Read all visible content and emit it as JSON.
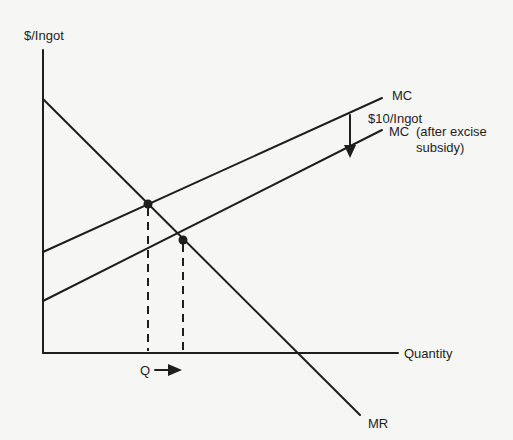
{
  "diagram": {
    "axes": {
      "y_label": "$/Ingot",
      "x_label": "Quantity"
    },
    "curves": {
      "mc": {
        "label": "MC"
      },
      "mc_subsidy": {
        "label": "MC",
        "note_line1": "(after excise",
        "note_line2": "subsidy)"
      },
      "mr": {
        "label": "MR"
      }
    },
    "annotations": {
      "shift_amount": "$10/Ingot",
      "quantity_marker": "Q"
    },
    "points": [
      {
        "name": "equilibrium-before-subsidy",
        "x": 148,
        "y": 204
      },
      {
        "name": "equilibrium-after-subsidy",
        "x": 183,
        "y": 240
      }
    ],
    "colors": {
      "ink": "#1e1e1e",
      "background": "#f6f6f4"
    }
  }
}
